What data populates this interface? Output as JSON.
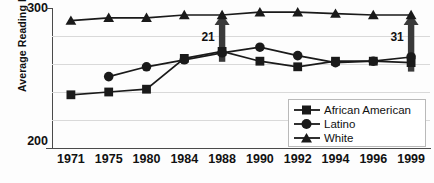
{
  "chart_data": {
    "type": "line",
    "title": "",
    "xlabel": "",
    "ylabel": "Average Reading NAEP Score",
    "categories": [
      "1971",
      "1975",
      "1980",
      "1984",
      "1988",
      "1990",
      "1992",
      "1994",
      "1996",
      "1999"
    ],
    "ylim": [
      200,
      300
    ],
    "ytick_labels": [
      "300",
      "200"
    ],
    "gridlines": [
      220,
      240,
      260,
      280
    ],
    "grid": true,
    "legend_position": "inside-bottom-right",
    "series": [
      {
        "name": "African American",
        "marker": "square",
        "values": [
          238,
          240,
          242,
          264,
          269,
          262,
          258,
          262,
          262,
          261
        ]
      },
      {
        "name": "Latino",
        "marker": "circle",
        "values": [
          null,
          251,
          258,
          263,
          268,
          272,
          266,
          261,
          262,
          265
        ]
      },
      {
        "name": "White",
        "marker": "triangle",
        "values": [
          291,
          293,
          293,
          295,
          295,
          297,
          297,
          296,
          295,
          295
        ]
      }
    ],
    "annotations": [
      {
        "label": "21",
        "at_category": "1988",
        "type": "gap-arrow"
      },
      {
        "label": "31",
        "at_category": "1999",
        "type": "gap-arrow"
      }
    ]
  },
  "legend": {
    "items": [
      {
        "label": "African American",
        "marker": "square-marker-icon"
      },
      {
        "label": "Latino",
        "marker": "circle-marker-icon"
      },
      {
        "label": "White",
        "marker": "triangle-marker-icon"
      }
    ]
  },
  "colors": {
    "series": "#1a1a1a",
    "grid": "#d9d9d9",
    "axis": "#4a4a4a",
    "annotation": "#3a3a3a",
    "background": "#fdfdfd"
  }
}
